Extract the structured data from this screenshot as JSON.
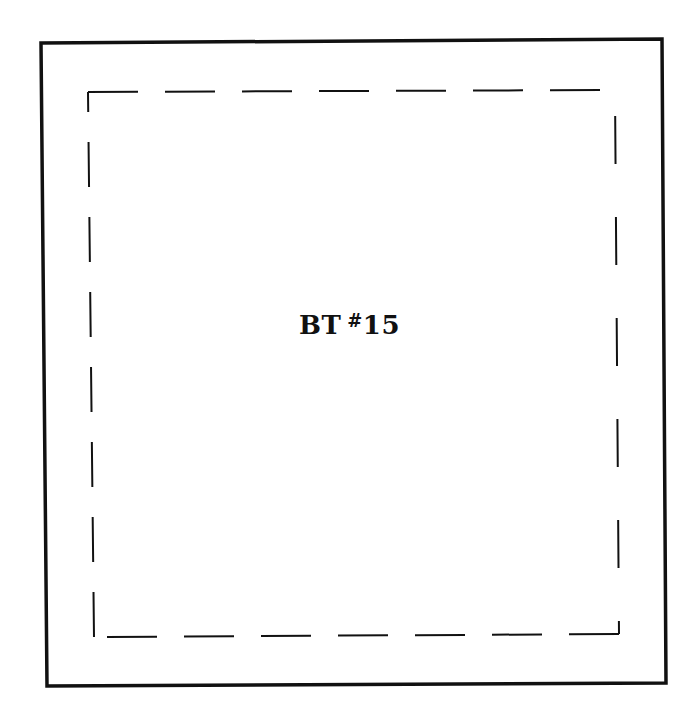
{
  "label": {
    "prefix": "BT",
    "hash": "#",
    "number": "15"
  },
  "colors": {
    "ink": "#111111",
    "background": "#ffffff"
  },
  "outer_border": {
    "points": [
      [
        41,
        43
      ],
      [
        662,
        39
      ],
      [
        666,
        683
      ],
      [
        47,
        686
      ]
    ],
    "stroke_width": 3.5
  },
  "dashed_border": {
    "edges": [
      {
        "name": "top",
        "from": [
          88,
          92
        ],
        "to": [
          615,
          90
        ],
        "dash": "50 27"
      },
      {
        "name": "right",
        "from": [
          615,
          90
        ],
        "to": [
          619,
          634
        ],
        "dash": "0 26 48 27"
      },
      {
        "name": "bottom",
        "from": [
          619,
          634
        ],
        "to": [
          94,
          637
        ],
        "dash": "50 27"
      },
      {
        "name": "left",
        "from": [
          94,
          637
        ],
        "to": [
          88,
          92
        ],
        "dash": "45 30"
      }
    ],
    "stroke_width": 2
  }
}
